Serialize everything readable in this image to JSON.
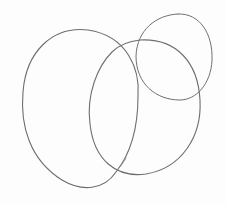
{
  "image": {
    "width": 226,
    "height": 204,
    "background": "#fdfdfd",
    "description": "Hand-drawn pencil sketch of three overlapping ovals"
  },
  "shapes": [
    {
      "name": "left-oval",
      "stroke": "#6e6e6e",
      "stroke_width": 1.1,
      "path": "M 138 96 C 140 70, 128 36, 88 30 C 52 26, 26 52, 23 92 C 20 126, 30 160, 62 180 C 82 192, 104 190, 116 172 C 132 152, 138 124, 138 96"
    },
    {
      "name": "middle-oval",
      "stroke": "#6e6e6e",
      "stroke_width": 1.1,
      "path": "M 140 40 C 176 38, 198 62, 200 100 C 202 136, 182 168, 146 174 C 116 178, 94 160, 90 124 C 86 94, 98 66, 112 52 C 120 44, 130 41, 140 40"
    },
    {
      "name": "right-circle",
      "stroke": "#707070",
      "stroke_width": 1.0,
      "path": "M 178 14 C 200 13, 213 34, 212 60 C 211 84, 196 100, 180 100 C 156 100, 136 84, 136 56 C 137 30, 156 15, 178 14"
    },
    {
      "name": "overlap-smudge",
      "stroke": "#8a8a8a",
      "stroke_width": 0.9,
      "path": "M 126 158 C 123 163, 120 167, 117 170"
    }
  ]
}
